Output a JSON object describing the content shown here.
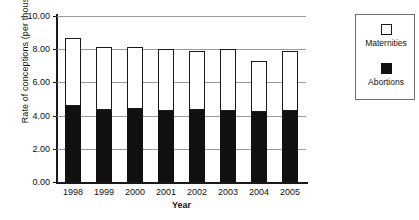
{
  "chart_data": {
    "type": "bar",
    "stacked": true,
    "title": "",
    "xlabel": "Year",
    "ylabel": "Rate of conceptions (per thousands)",
    "categories": [
      "1998",
      "1999",
      "2000",
      "2001",
      "2002",
      "2003",
      "2004",
      "2005"
    ],
    "ylim": [
      0,
      10
    ],
    "ytick_labels": [
      "0.00",
      "2.00",
      "4.00",
      "6.00",
      "8.00",
      "10.00"
    ],
    "ytick_values": [
      0,
      2,
      4,
      6,
      8,
      10
    ],
    "grid": true,
    "legend_position": "right",
    "series": [
      {
        "name": "Abortions",
        "color": "#111111",
        "values": [
          4.55,
          4.35,
          4.4,
          4.3,
          4.35,
          4.3,
          4.2,
          4.3
        ]
      },
      {
        "name": "Maternities",
        "color": "#ffffff",
        "values": [
          4.15,
          3.8,
          3.75,
          3.7,
          3.55,
          3.7,
          3.1,
          3.6
        ]
      }
    ],
    "totals": [
      8.7,
      8.15,
      8.15,
      8.0,
      7.9,
      8.0,
      7.3,
      7.9
    ]
  },
  "legend": {
    "items": [
      {
        "label": "Maternities",
        "swatch": "white-square-icon"
      },
      {
        "label": "Abortions",
        "swatch": "black-square-icon"
      }
    ]
  }
}
